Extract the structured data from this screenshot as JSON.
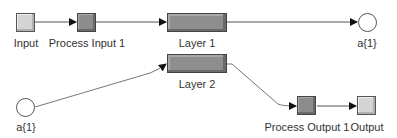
{
  "diagram": {
    "nodes": {
      "input": {
        "label": "Input",
        "kind": "input-block"
      },
      "process_input_1": {
        "label": "Process Input 1",
        "kind": "process-block"
      },
      "layer_1": {
        "label": "Layer 1",
        "kind": "layer"
      },
      "output_a1_top": {
        "label": "a{1}",
        "kind": "layer-output"
      },
      "layer_2": {
        "label": "Layer 2",
        "kind": "layer"
      },
      "input_a1_bottom": {
        "label": "a{1}",
        "kind": "layer-input"
      },
      "process_output_1": {
        "label": "Process Output 1",
        "kind": "process-block"
      },
      "output": {
        "label": "Output",
        "kind": "output-block"
      }
    },
    "edges": [
      {
        "from": "Input",
        "to": "Process Input 1"
      },
      {
        "from": "Process Input 1",
        "to": "Layer 1"
      },
      {
        "from": "Layer 1",
        "to": "a{1}"
      },
      {
        "from": "a{1}",
        "to": "Layer 2"
      },
      {
        "from": "Layer 2",
        "to": "Process Output 1"
      },
      {
        "from": "Process Output 1",
        "to": "Output"
      }
    ],
    "colors": {
      "light_block": "#d4d4d4",
      "dark_block": "#8c8c8c",
      "line": "#555555"
    }
  }
}
